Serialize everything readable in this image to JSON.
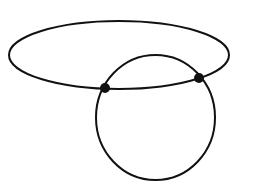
{
  "diagram": {
    "background": "#ffffff",
    "stroke_color": "#111111",
    "stroke_width": 2,
    "shapes": [
      {
        "name": "ellipse",
        "cx": 119,
        "cy": 55,
        "rx": 110,
        "ry": 34
      },
      {
        "name": "circle",
        "cx": 155.5,
        "cy": 117.5,
        "rx": 59.5,
        "ry": 62.5
      }
    ],
    "points": [
      {
        "name": "intersection-left",
        "x": 105,
        "y": 88,
        "r": 5
      },
      {
        "name": "intersection-right",
        "x": 199,
        "y": 78,
        "r": 5
      }
    ]
  }
}
